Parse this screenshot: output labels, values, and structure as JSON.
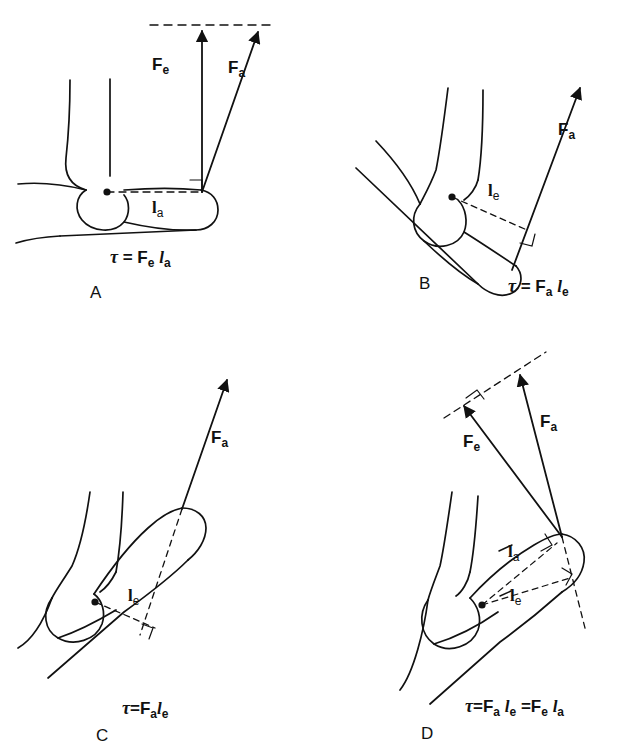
{
  "figure": {
    "stroke_color": "#111111",
    "background": "#ffffff"
  },
  "panels": [
    {
      "id": "A",
      "letter": "A",
      "equation_html": "<span class='tau'>&tau;</span> = F<sub>e</sub> l<sub>a</sub>",
      "equation_text": "τ = Fe la",
      "force_labels": [
        {
          "name": "F_e",
          "base": "F",
          "sub": "e",
          "x": 160,
          "y": 63
        },
        {
          "name": "F_a",
          "base": "F",
          "sub": "a",
          "x": 236,
          "y": 66
        }
      ],
      "arm_labels": [
        {
          "name": "l_a",
          "base": "l",
          "sub": "a",
          "x": 159,
          "y": 207
        }
      ],
      "description": "Forearm horizontal, forces vertical, moment arm l_a horizontal"
    },
    {
      "id": "B",
      "letter": "B",
      "equation_html": "<span class='tau'>&tau;</span> = F<sub>a</sub> l<sub>e</sub>",
      "equation_text": "τ = Fa le",
      "force_labels": [
        {
          "name": "F_a",
          "base": "F",
          "sub": "a",
          "x": 565,
          "y": 128
        }
      ],
      "arm_labels": [
        {
          "name": "l_e",
          "base": "l",
          "sub": "e",
          "x": 494,
          "y": 190
        }
      ],
      "description": "Forearm flexed, single force along forearm, perpendicular moment arm l_e"
    },
    {
      "id": "C",
      "letter": "C",
      "equation_html": "<span class='tau'>&tau;</span> = F<sub>a</sub>l<sub>e</sub>",
      "equation_text": "τ = Fale",
      "force_labels": [
        {
          "name": "F_a",
          "base": "F",
          "sub": "a",
          "x": 218,
          "y": 436
        }
      ],
      "arm_labels": [
        {
          "name": "l_e",
          "base": "l",
          "sub": "e",
          "x": 134,
          "y": 595
        }
      ],
      "description": "Arm rotated, force line of action extended with dashed line, moment arm l_e"
    },
    {
      "id": "D",
      "letter": "D",
      "equation_html": "<span class='tau'>&tau;</span>=F<sub>a</sub> l<sub>e</sub> =F<sub>e</sub> l<sub>a</sub>",
      "equation_text": "τ=Fa le =Fe la",
      "force_labels": [
        {
          "name": "F_e",
          "base": "F",
          "sub": "e",
          "x": 470,
          "y": 440
        },
        {
          "name": "F_a",
          "base": "F",
          "sub": "a",
          "x": 547,
          "y": 420
        }
      ],
      "arm_labels": [
        {
          "name": "l_a",
          "base": "l",
          "sub": "a",
          "x": 508,
          "y": 548
        },
        {
          "name": "l_e",
          "base": "l",
          "sub": "e",
          "x": 512,
          "y": 592
        }
      ],
      "description": "Two forces from common insertion point, two moment arms l_a and l_e"
    }
  ],
  "panel_letters": {
    "A": {
      "x": 90,
      "y": 283
    },
    "B": {
      "x": 419,
      "y": 274
    },
    "C": {
      "x": 96,
      "y": 726
    },
    "D": {
      "x": 421,
      "y": 724
    }
  },
  "equation_positions": {
    "A": {
      "x": 110,
      "y": 247
    },
    "B": {
      "x": 508,
      "y": 276
    },
    "C": {
      "x": 122,
      "y": 698
    },
    "D": {
      "x": 465,
      "y": 696
    }
  }
}
